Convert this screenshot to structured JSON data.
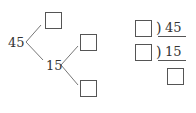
{
  "factor_tree": {
    "root": "45",
    "branch_left_box": "",
    "middle": "15",
    "leaf_top_box": "",
    "leaf_bottom_box": ""
  },
  "division_ladder": {
    "rows": [
      {
        "divisor_box": "",
        "bracket": ")",
        "dividend": "45"
      },
      {
        "divisor_box": "",
        "bracket": ")",
        "dividend": "15"
      }
    ],
    "result_box": ""
  }
}
